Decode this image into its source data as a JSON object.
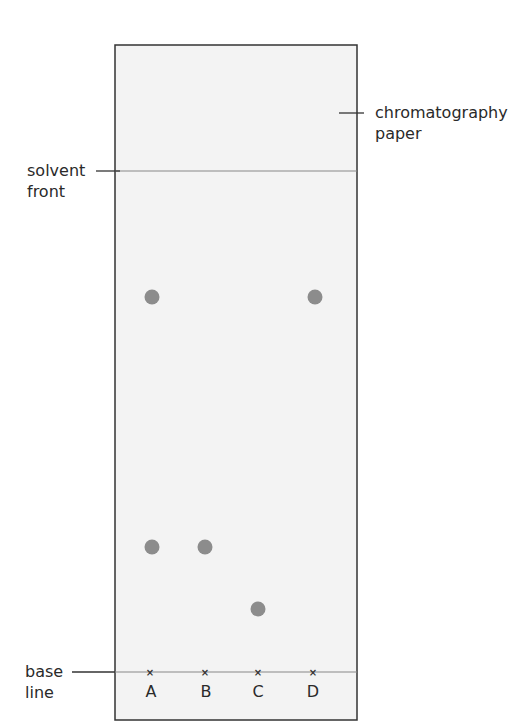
{
  "diagram": {
    "title": "",
    "labels": {
      "paper_line1": "chromatography",
      "paper_line2": "paper",
      "solvent_line1": "solvent",
      "solvent_line2": "front",
      "base_line1": "base",
      "base_line2": "line"
    },
    "lanes": [
      {
        "label": "A",
        "x": 150
      },
      {
        "label": "B",
        "x": 205
      },
      {
        "label": "C",
        "x": 258
      },
      {
        "label": "D",
        "x": 313
      }
    ],
    "spots": [
      {
        "lane": "A",
        "x": 152,
        "y": 297
      },
      {
        "lane": "A",
        "x": 152,
        "y": 547
      },
      {
        "lane": "B",
        "x": 205,
        "y": 547
      },
      {
        "lane": "C",
        "x": 258,
        "y": 609
      },
      {
        "lane": "D",
        "x": 315,
        "y": 297
      }
    ],
    "colors": {
      "paper": "#f4f4f4",
      "border": "#333333",
      "spot": "#8c8c8c",
      "line": "#777777"
    }
  }
}
